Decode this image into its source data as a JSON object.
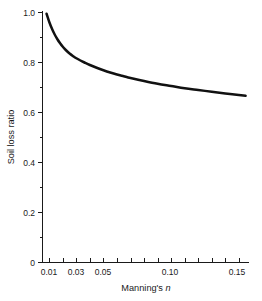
{
  "chart_data": {
    "type": "line",
    "title": "",
    "subtitle": "",
    "xlabel": "Manning's n",
    "xlabel_plain": "Manning's",
    "xlabel_italic": "n",
    "ylabel": "Soil loss ratio",
    "xlim": [
      0.005,
      0.1575
    ],
    "ylim": [
      0,
      1.0
    ],
    "grid": false,
    "legend": null,
    "x_tick_labels": [
      "0.01",
      "0.03",
      "0.05",
      "0.10",
      "0.15"
    ],
    "x_tick_values": [
      0.01,
      0.03,
      0.05,
      0.1,
      0.15
    ],
    "x_minor_ticks": [
      0.01,
      0.02,
      0.03,
      0.04,
      0.05,
      0.06,
      0.07,
      0.08,
      0.09,
      0.1,
      0.11,
      0.12,
      0.13,
      0.14,
      0.15
    ],
    "y_tick_labels": [
      "0",
      "0.2",
      "0.4",
      "0.6",
      "0.8",
      "1.0"
    ],
    "y_tick_values": [
      0,
      0.2,
      0.4,
      0.6,
      0.8,
      1.0
    ],
    "y_minor_ticks": [
      0.1,
      0.3,
      0.5,
      0.7,
      0.9
    ],
    "series": [
      {
        "name": "Soil loss ratio",
        "color": "#111111",
        "x": [
          0.008,
          0.01,
          0.012,
          0.014,
          0.016,
          0.018,
          0.02,
          0.022,
          0.025,
          0.028,
          0.03,
          0.033,
          0.036,
          0.04,
          0.045,
          0.05,
          0.055,
          0.06,
          0.065,
          0.07,
          0.08,
          0.09,
          0.1,
          0.11,
          0.12,
          0.13,
          0.14,
          0.15,
          0.155
        ],
        "y": [
          0.995,
          0.962,
          0.935,
          0.912,
          0.893,
          0.877,
          0.863,
          0.851,
          0.836,
          0.824,
          0.817,
          0.808,
          0.8,
          0.79,
          0.779,
          0.769,
          0.76,
          0.752,
          0.745,
          0.738,
          0.726,
          0.715,
          0.706,
          0.697,
          0.69,
          0.683,
          0.676,
          0.67,
          0.667
        ]
      }
    ]
  },
  "axes": {
    "y_label_text": "Soil loss ratio",
    "x_label_prefix": "Manning's",
    "x_label_symbol": "n"
  }
}
